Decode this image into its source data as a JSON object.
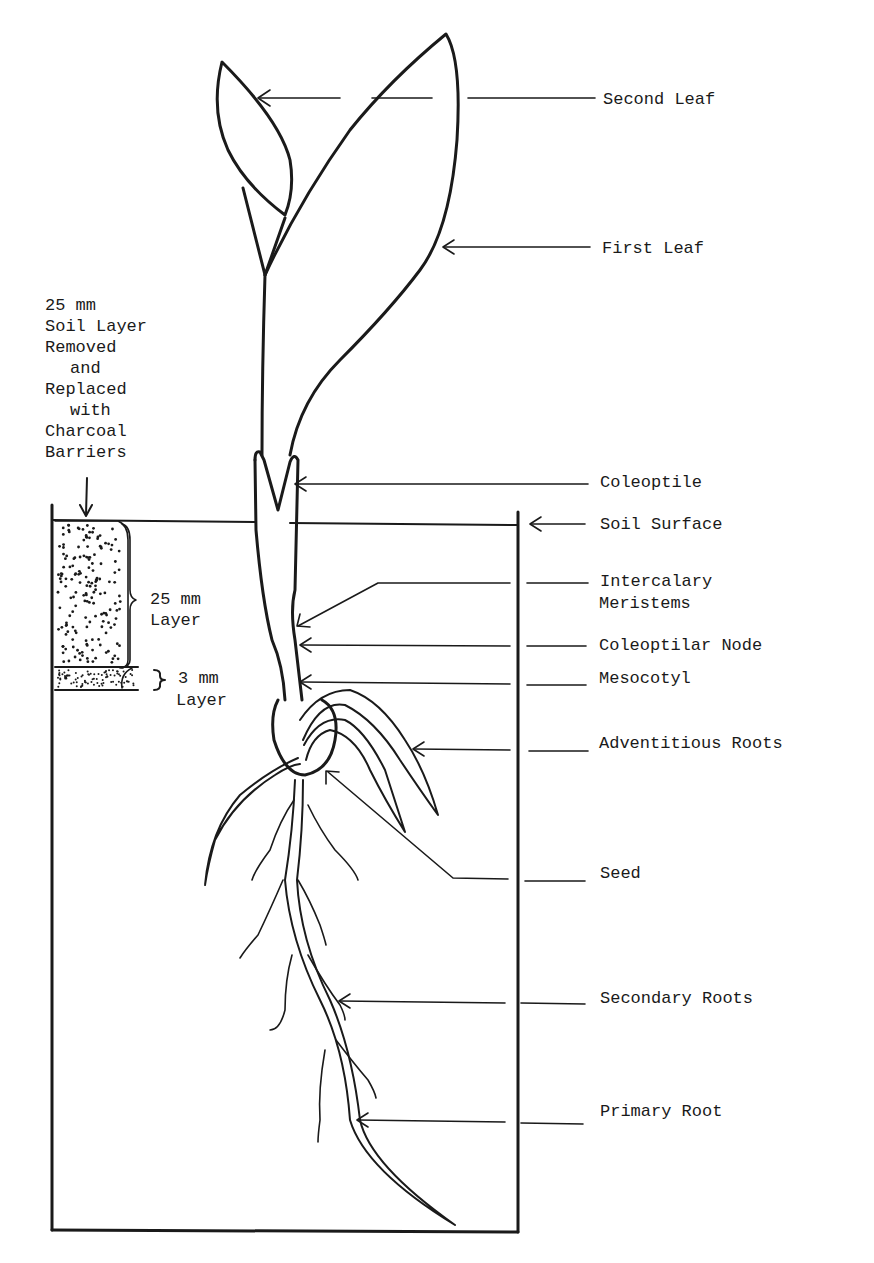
{
  "figure": {
    "labels": {
      "second_leaf": "Second Leaf",
      "first_leaf": "First Leaf",
      "coleoptile": "Coleoptile",
      "soil_surface": "Soil Surface",
      "intercalary_1": "Intercalary",
      "intercalary_2": "Meristems",
      "coleoptilar_node": "Coleoptilar Node",
      "mesocotyl": "Mesocotyl",
      "adventitious_roots": "Adventitious Roots",
      "seed": "Seed",
      "secondary_roots": "Secondary Roots",
      "primary_root": "Primary Root"
    },
    "soil_note": [
      "25 mm",
      "Soil Layer",
      "Removed",
      "and",
      "Replaced",
      "with",
      "Charcoal",
      "Barriers"
    ],
    "layer_25": [
      "25 mm",
      "Layer"
    ],
    "layer_3": [
      "3 mm",
      "Layer"
    ]
  }
}
